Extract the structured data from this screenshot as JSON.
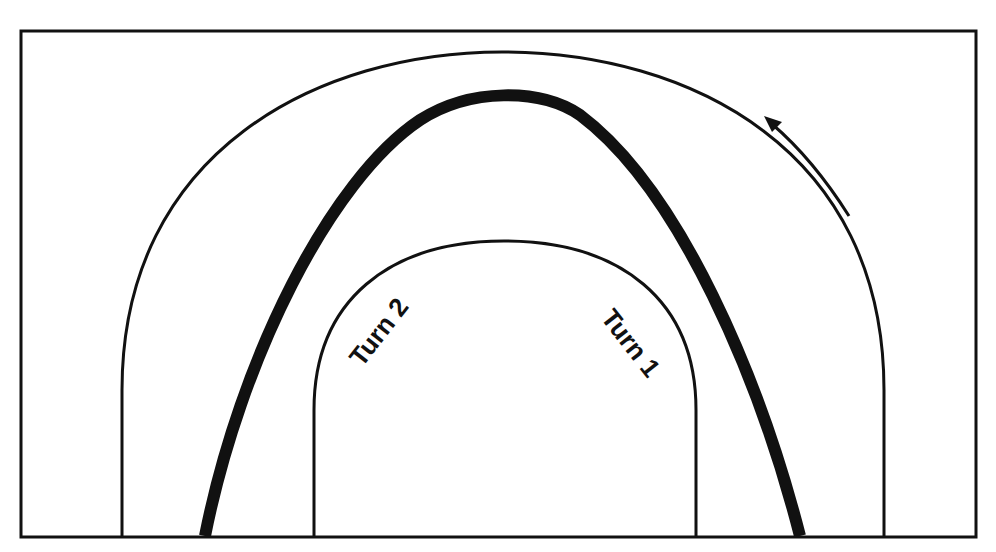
{
  "caption": {
    "text": "",
    "note": "clipped text at top edge"
  },
  "diagram": {
    "type": "racetrack-line",
    "colors": {
      "stroke": "#111111",
      "background": "#ffffff"
    },
    "labels": {
      "turn1": "Turn 1",
      "turn2": "Turn 2"
    },
    "direction": "counter-clockwise"
  }
}
